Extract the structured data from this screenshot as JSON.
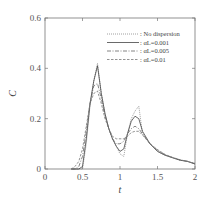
{
  "chart_data": {
    "type": "line",
    "title": "",
    "xlabel": "t",
    "ylabel": "C",
    "xlim": [
      0,
      2
    ],
    "ylim": [
      0,
      0.6
    ],
    "xticks": [
      "0",
      "0.5",
      "1",
      "1.5",
      "2"
    ],
    "yticks": [
      "0",
      "0.2",
      "0.4",
      "0.6"
    ],
    "grid": false,
    "legend_position": "upper right",
    "x": [
      0.35,
      0.4,
      0.45,
      0.5,
      0.55,
      0.6,
      0.65,
      0.7,
      0.75,
      0.8,
      0.85,
      0.9,
      0.95,
      1.0,
      1.05,
      1.1,
      1.15,
      1.2,
      1.25,
      1.3,
      1.4,
      1.5,
      1.6,
      1.7,
      1.8,
      1.9,
      2.0
    ],
    "series": [
      {
        "name": ": No dispersion",
        "style": "dotted",
        "values": [
          0,
          0,
          0,
          0,
          0.1,
          0.25,
          0.35,
          0.42,
          0.3,
          0.22,
          0.16,
          0.12,
          0.09,
          0.06,
          0.05,
          0.14,
          0.2,
          0.23,
          0.25,
          0.14,
          0.1,
          0.07,
          0.055,
          0.045,
          0.035,
          0.03,
          0.02
        ]
      },
      {
        "name": ": αL=0.001",
        "style": "solid",
        "values": [
          0,
          0,
          0,
          0.01,
          0.12,
          0.26,
          0.35,
          0.41,
          0.3,
          0.22,
          0.16,
          0.12,
          0.09,
          0.07,
          0.08,
          0.14,
          0.19,
          0.21,
          0.2,
          0.15,
          0.1,
          0.07,
          0.055,
          0.045,
          0.035,
          0.03,
          0.02
        ]
      },
      {
        "name": ": αL=0.005",
        "style": "dash-dot",
        "values": [
          0,
          0,
          0.01,
          0.05,
          0.15,
          0.26,
          0.33,
          0.34,
          0.28,
          0.21,
          0.16,
          0.12,
          0.1,
          0.1,
          0.11,
          0.14,
          0.16,
          0.17,
          0.16,
          0.14,
          0.1,
          0.075,
          0.057,
          0.045,
          0.036,
          0.03,
          0.022
        ]
      },
      {
        "name": ": αL=0.01",
        "style": "dashed",
        "values": [
          0,
          0.01,
          0.03,
          0.08,
          0.17,
          0.26,
          0.3,
          0.31,
          0.26,
          0.2,
          0.16,
          0.13,
          0.12,
          0.12,
          0.12,
          0.13,
          0.145,
          0.15,
          0.15,
          0.135,
          0.1,
          0.077,
          0.058,
          0.046,
          0.037,
          0.03,
          0.022
        ]
      }
    ]
  }
}
